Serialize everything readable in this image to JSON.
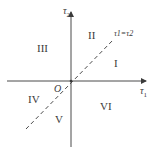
{
  "diagram": {
    "axes": {
      "x_label": "τ",
      "x_sub": "1",
      "y_label": "τ",
      "y_sub": "2"
    },
    "origin_label": "O",
    "diagonal_label": "τ1=τ2",
    "regions": [
      "I",
      "II",
      "III",
      "IV",
      "V",
      "VI"
    ],
    "colors": {
      "line": "#4a4a4a",
      "text": "#3a3a3a",
      "background": "#ffffff"
    }
  }
}
